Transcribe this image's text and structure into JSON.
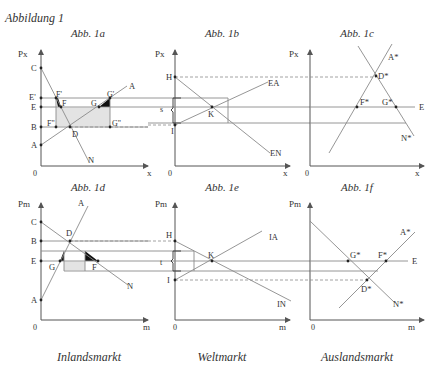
{
  "figure_title": "Abbildung 1",
  "panels": {
    "a": {
      "title": "Abb. 1a",
      "y_axis": "Px",
      "x_axis": "x",
      "origin": "0",
      "points": {
        "C": "C",
        "E_prime": "E'",
        "E": "E",
        "B": "B",
        "A": "A",
        "F_prime": "F'",
        "F": "F",
        "G": "G",
        "G_prime": "G'",
        "F_dprime": "F\"",
        "G_dprime": "G\"",
        "D": "D"
      },
      "curves": {
        "supply": "A",
        "demand": "N"
      }
    },
    "b": {
      "title": "Abb. 1b",
      "y_axis": "Px",
      "x_axis": "x",
      "origin": "0",
      "points": {
        "H": "H",
        "I": "I",
        "K": "K",
        "s": "s"
      },
      "curves": {
        "export_supply": "EA",
        "export_demand": "EN"
      }
    },
    "c": {
      "title": "Abb. 1c",
      "y_axis": "Px",
      "x_axis": "x",
      "origin": "0",
      "points": {
        "D_star": "D*",
        "F_star": "F*",
        "G_star": "G*",
        "E": "E"
      },
      "curves": {
        "supply": "A*",
        "demand": "N*"
      }
    },
    "d": {
      "title": "Abb. 1d",
      "y_axis": "Pm",
      "x_axis": "m",
      "origin": "0",
      "points": {
        "C": "C",
        "B": "B",
        "E": "E",
        "A": "A",
        "D": "D",
        "G": "G",
        "F": "F"
      },
      "curves": {
        "supply": "A",
        "demand": "N"
      }
    },
    "e": {
      "title": "Abb. 1e",
      "y_axis": "Pm",
      "x_axis": "m",
      "origin": "0",
      "points": {
        "H": "H",
        "I": "I",
        "K": "K",
        "t": "t"
      },
      "curves": {
        "import_supply": "IA",
        "import_demand": "IN"
      }
    },
    "f": {
      "title": "Abb. 1f",
      "y_axis": "Pm",
      "x_axis": "m",
      "origin": "0",
      "points": {
        "G_star": "G*",
        "F_star": "F*",
        "D_star": "D*",
        "E": "E"
      },
      "curves": {
        "supply": "A*",
        "demand": "N*"
      }
    }
  },
  "footer": {
    "left": "Inlandsmarkt",
    "center": "Weltmarkt",
    "right": "Auslandsmarkt"
  }
}
